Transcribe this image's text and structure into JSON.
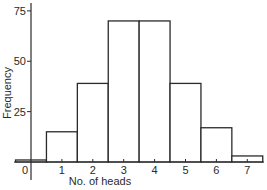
{
  "chart_data": {
    "type": "bar",
    "subtype": "histogram",
    "title": "",
    "xlabel": "No. of heads",
    "ylabel": "Frequency",
    "categories": [
      "0",
      "1",
      "2",
      "3",
      "4",
      "5",
      "6",
      "7"
    ],
    "x": [
      0,
      1,
      2,
      3,
      4,
      5,
      6,
      7
    ],
    "values": [
      1,
      15,
      39,
      70,
      70,
      39,
      17,
      3
    ],
    "xlim": [
      -0.5,
      7.5
    ],
    "ylim": [
      0,
      78
    ],
    "yticks": [
      25,
      50,
      75
    ],
    "xticks": [
      0,
      1,
      2,
      3,
      4,
      5,
      6,
      7
    ],
    "grid": false,
    "legend": null,
    "colors": {
      "stroke": "#2a2a2a",
      "fill": "#ffffff"
    }
  }
}
